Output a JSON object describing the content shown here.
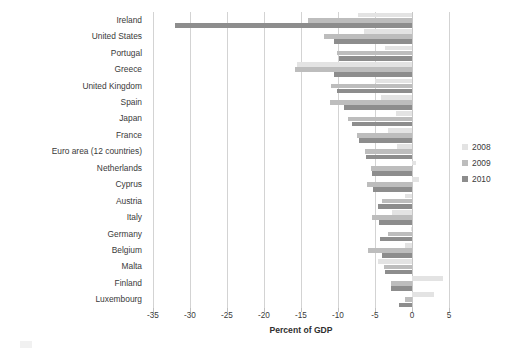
{
  "chart_data": {
    "type": "bar",
    "orientation": "horizontal",
    "title": "",
    "xlabel": "Percent of GDP",
    "ylabel": "",
    "xlim": [
      -35,
      5
    ],
    "xticks": [
      -35,
      -30,
      -25,
      -20,
      -15,
      -10,
      -5,
      0,
      5
    ],
    "xtick_labels": [
      "-35",
      "-30",
      "-25",
      "-20",
      "-15",
      "-10",
      "-5",
      "0",
      "5"
    ],
    "grid": true,
    "legend_position": "right",
    "categories": [
      "Ireland",
      "United States",
      "Portugal",
      "Greece",
      "United Kingdom",
      "Spain",
      "Japan",
      "France",
      "Euro area (12 countries)",
      "Netherlands",
      "Cyprus",
      "Austria",
      "Italy",
      "Germany",
      "Belgium",
      "Malta",
      "Finland",
      "Luxembourg"
    ],
    "series": [
      {
        "name": "2008",
        "color": "#e3e3e3",
        "values": [
          -7.3,
          -6.5,
          -3.6,
          -15.6,
          -5.0,
          -4.2,
          -2.2,
          -3.3,
          -2.0,
          0.5,
          0.9,
          -0.9,
          -2.7,
          -0.1,
          -1.0,
          -4.6,
          4.2,
          3.0
        ]
      },
      {
        "name": "2009",
        "color": "#bdbdbd",
        "values": [
          -14.0,
          -11.9,
          -10.1,
          -15.8,
          -11.0,
          -11.1,
          -8.7,
          -7.5,
          -6.3,
          -5.5,
          -6.1,
          -4.1,
          -5.4,
          -3.2,
          -5.9,
          -3.8,
          -2.9,
          -0.9
        ]
      },
      {
        "name": "2010",
        "color": "#8d8d8d",
        "values": [
          -32.0,
          -10.6,
          -9.8,
          -10.5,
          -10.2,
          -9.2,
          -8.1,
          -7.1,
          -6.2,
          -5.4,
          -5.3,
          -4.6,
          -4.5,
          -4.3,
          -4.1,
          -3.6,
          -2.8,
          -1.7
        ]
      }
    ]
  },
  "legend": {
    "items": [
      {
        "label": "2008",
        "color": "#e3e3e3"
      },
      {
        "label": "2009",
        "color": "#bdbdbd"
      },
      {
        "label": "2010",
        "color": "#8d8d8d"
      }
    ]
  }
}
